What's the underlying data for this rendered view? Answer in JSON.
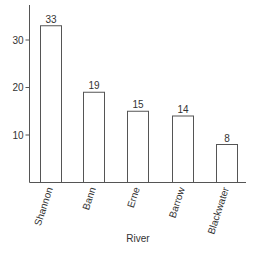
{
  "chart_data": {
    "type": "bar",
    "title": "",
    "xlabel": "River",
    "ylabel": "",
    "categories": [
      "Shannon",
      "Bann",
      "Erne",
      "Barrow",
      "Blackwater"
    ],
    "values": [
      33,
      19,
      15,
      14,
      8
    ],
    "data_labels": [
      "33",
      "19",
      "15",
      "14",
      "8"
    ],
    "yticks": [
      10,
      20,
      30
    ],
    "ytick_labels": [
      "10",
      "20",
      "30"
    ],
    "ylim": [
      0,
      36
    ],
    "grid": false,
    "legend": null,
    "bar_fill": "#ffffff",
    "bar_stroke": "#555555",
    "axis_color": "#555555"
  }
}
